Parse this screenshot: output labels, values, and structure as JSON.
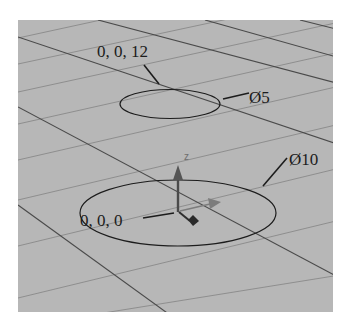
{
  "viewport": {
    "background_color": "#b7b7b7",
    "grid_dark_color": "#4a4a4a",
    "grid_light_color": "#8e8e8e",
    "outline_color": "#1c1c1c"
  },
  "circles": [
    {
      "label": "0, 0, 12",
      "diameter_label": "Ø5"
    },
    {
      "label": "0, 0, 0",
      "diameter_label": "Ø10"
    }
  ],
  "gizmo": {
    "z_label": "z",
    "z_color": "#5a5a5a",
    "x_color": "#7a7a7a",
    "y_color": "#2e2e2e"
  }
}
